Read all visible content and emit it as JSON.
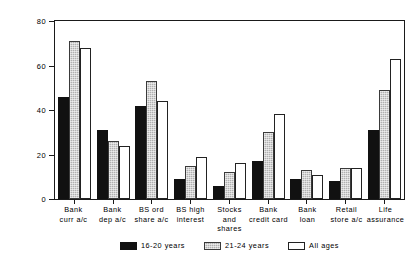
{
  "chart_data": {
    "type": "bar",
    "title": "",
    "xlabel": "",
    "ylabel": "Percentages",
    "ylim": [
      0,
      80
    ],
    "yticks": [
      0,
      20,
      40,
      60,
      80
    ],
    "grid": false,
    "legend_position": "bottom",
    "categories": [
      "Bank curr a/c",
      "Bank dep a/c",
      "BS ord share a/c",
      "BS high interest",
      "Stocks and shares",
      "Bank credit card",
      "Bank loan",
      "Retail store a/c",
      "Life assurance"
    ],
    "category_lines": [
      [
        "Bank",
        "curr a/c"
      ],
      [
        "Bank",
        "dep a/c"
      ],
      [
        "BS ord",
        "share a/c"
      ],
      [
        "BS high",
        "interest"
      ],
      [
        "Stocks and",
        "shares"
      ],
      [
        "Bank",
        "credit card"
      ],
      [
        "Bank",
        "loan"
      ],
      [
        "Retail",
        "store a/c"
      ],
      [
        "Life",
        "assurance"
      ]
    ],
    "series": [
      {
        "name": "16-20 years",
        "color": "#111111",
        "values": [
          46,
          31,
          42,
          9,
          6,
          17,
          9,
          8,
          31
        ]
      },
      {
        "name": "21-24 years",
        "color": "#b0b0b0",
        "values": [
          71,
          26,
          53,
          15,
          12,
          30,
          13,
          14,
          49
        ]
      },
      {
        "name": "All ages",
        "color": "#ffffff",
        "values": [
          68,
          24,
          44,
          19,
          16,
          38,
          11,
          14,
          63
        ]
      }
    ]
  }
}
